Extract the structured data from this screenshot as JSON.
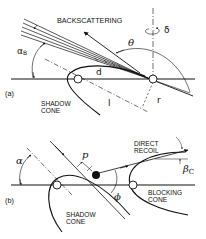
{
  "panels": {
    "a": {
      "tag": "(a)",
      "labels": {
        "backscattering": "BACKSCATTERING",
        "shadow_cone_1": "SHADOW",
        "shadow_cone_2": "CONE",
        "alpha_b": "α",
        "alpha_b_sub": "B",
        "theta": "θ",
        "delta": "δ",
        "d": "d",
        "l": "l",
        "r": "r"
      }
    },
    "b": {
      "tag": "(b)",
      "labels": {
        "direct_recoil_1": "DIRECT",
        "direct_recoil_2": "RECOIL",
        "blocking_cone_1": "BLOCKING",
        "blocking_cone_2": "CONE",
        "shadow_cone_1": "SHADOW",
        "shadow_cone_2": "CONE",
        "alpha": "α",
        "p": "p",
        "phi": "ϕ",
        "beta_c": "β",
        "beta_c_sub": "C"
      }
    }
  },
  "colors": {
    "ink": "#111111",
    "background": "#ffffff"
  }
}
